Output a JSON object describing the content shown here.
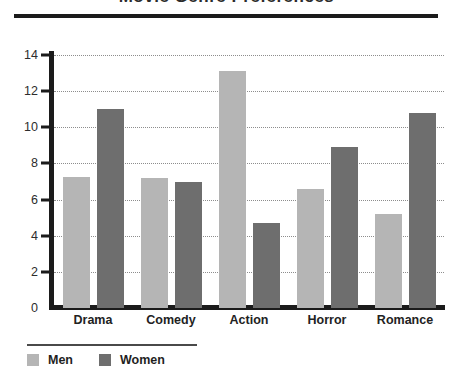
{
  "chart_data": {
    "type": "bar",
    "title": "Movie Genre Preferences",
    "xlabel": "",
    "ylabel": "",
    "ylim": [
      0,
      14
    ],
    "yticks": [
      0,
      2,
      4,
      6,
      8,
      10,
      12,
      14
    ],
    "grid": true,
    "legend_position": "bottom-left",
    "categories": [
      "Drama",
      "Comedy",
      "Action",
      "Horror",
      "Romance"
    ],
    "series": [
      {
        "name": "Men",
        "color": "#b5b5b5",
        "values": [
          7.25,
          7.2,
          13.1,
          6.6,
          5.2
        ]
      },
      {
        "name": "Women",
        "color": "#6e6e6e",
        "values": [
          11.0,
          6.95,
          4.7,
          8.9,
          10.8
        ]
      }
    ]
  },
  "legend": {
    "items": [
      {
        "label": "Men"
      },
      {
        "label": "Women"
      }
    ]
  }
}
